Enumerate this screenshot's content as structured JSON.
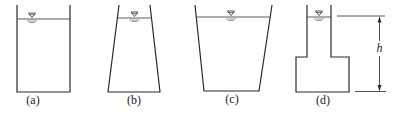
{
  "figure": {
    "colors": {
      "line": "#2a2a2a",
      "water_line": "#4a4a4a",
      "background": "#ffffff"
    },
    "containers": [
      {
        "id": "a",
        "label": "(a)",
        "shape": "rectangular"
      },
      {
        "id": "b",
        "label": "(b)",
        "shape": "tapered-narrow-top"
      },
      {
        "id": "c",
        "label": "(c)",
        "shape": "tapered-wide-top"
      },
      {
        "id": "d",
        "label": "(d)",
        "shape": "stepped-narrow-neck"
      }
    ],
    "dimension": {
      "symbol": "h",
      "description": "water depth"
    },
    "water_symbol": "free-surface-triangle-icon"
  }
}
